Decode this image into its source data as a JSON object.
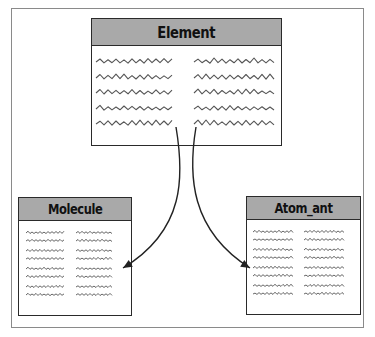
{
  "diagram": {
    "frame": {
      "border_color": "#8a8a8a"
    },
    "colors": {
      "header_fill": "#a9a9a9",
      "border": "#2a2a2a",
      "squiggle": "#555555",
      "arrow": "#222222"
    },
    "boxes": [
      {
        "id": "element",
        "title": "Element",
        "x": 91,
        "y": 18,
        "w": 191,
        "h": 128,
        "header_h": 26,
        "title_size": 16,
        "squiggle_rows": [
          62,
          78,
          93,
          109,
          124
        ],
        "columns": [
          [
            96,
            175
          ],
          [
            194,
            276
          ]
        ],
        "amp": 3.5,
        "period": 8
      },
      {
        "id": "molecule",
        "title": "Molecule",
        "x": 18,
        "y": 197,
        "w": 114,
        "h": 119,
        "header_h": 22,
        "title_size": 14,
        "squiggle_rows": [
          233,
          241,
          251,
          259,
          269,
          277,
          287,
          295
        ],
        "columns": [
          [
            26,
            64
          ],
          [
            76,
            113
          ]
        ],
        "amp": 1.6,
        "period": 4
      },
      {
        "id": "atom_ant",
        "title": "Atom_ant",
        "x": 246,
        "y": 196,
        "w": 115,
        "h": 119,
        "header_h": 22,
        "title_size": 14,
        "squiggle_rows": [
          232,
          240,
          250,
          258,
          268,
          276,
          286,
          294
        ],
        "columns": [
          [
            253,
            294
          ],
          [
            304,
            345
          ]
        ],
        "amp": 1.6,
        "period": 4
      }
    ],
    "arrows": [
      {
        "from": "element",
        "to": "molecule",
        "path": "M176,127 C184,175 186,230 123,268",
        "tip": [
          123,
          268
        ],
        "dir": [
          -1,
          0.6
        ]
      },
      {
        "from": "element",
        "to": "atom_ant",
        "path": "M196,127 C188,175 190,230 250,268",
        "tip": [
          250,
          268
        ],
        "dir": [
          1,
          0.6
        ]
      }
    ]
  }
}
